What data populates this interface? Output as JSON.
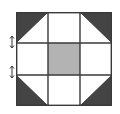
{
  "diagram": {
    "type": "quilt-block",
    "pattern": "churn-dash",
    "grid": {
      "rows": 3,
      "cols": 3
    },
    "colors": {
      "background": "#ffffff",
      "line": "#3a3a3a",
      "dark": "#444444",
      "center": "#b3b3b3"
    },
    "cells": [
      {
        "row": 0,
        "col": 0,
        "kind": "half-square-triangle",
        "dark": "top-left"
      },
      {
        "row": 0,
        "col": 1,
        "kind": "plain"
      },
      {
        "row": 0,
        "col": 2,
        "kind": "half-square-triangle",
        "dark": "top-right"
      },
      {
        "row": 1,
        "col": 0,
        "kind": "plain"
      },
      {
        "row": 1,
        "col": 1,
        "kind": "filled",
        "fill": "center"
      },
      {
        "row": 1,
        "col": 2,
        "kind": "plain"
      },
      {
        "row": 2,
        "col": 0,
        "kind": "half-square-triangle",
        "dark": "bottom-left"
      },
      {
        "row": 2,
        "col": 1,
        "kind": "plain"
      },
      {
        "row": 2,
        "col": 2,
        "kind": "half-square-triangle",
        "dark": "bottom-right"
      }
    ],
    "markers": [
      {
        "icon": "double-arrow-vertical-icon",
        "position": "left-row-1-top"
      },
      {
        "icon": "double-arrow-vertical-icon",
        "position": "left-row-1-bottom"
      }
    ]
  }
}
